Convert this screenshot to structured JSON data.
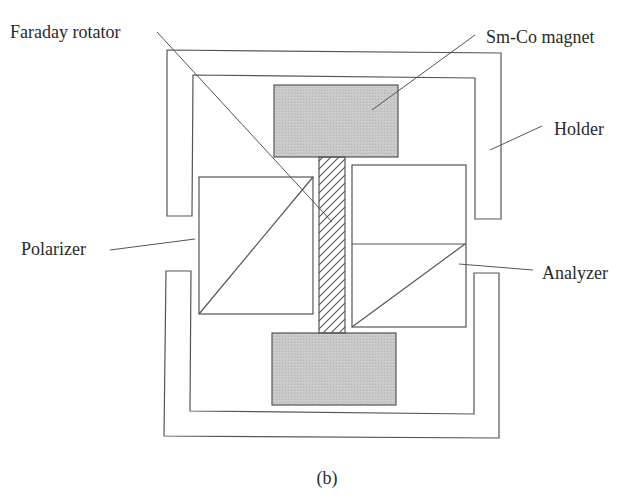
{
  "diagram": {
    "caption": "(b)",
    "colors": {
      "line": "#555555",
      "magnet_fill": "#c8c8c8",
      "text": "#2a2a2a",
      "background": "#ffffff"
    },
    "labels": {
      "faraday_rotator": "Faraday rotator",
      "sm_co_magnet": "Sm-Co magnet",
      "holder": "Holder",
      "polarizer": "Polarizer",
      "analyzer": "Analyzer"
    },
    "components": [
      {
        "id": "holder",
        "label": "Holder",
        "type": "bracket-frame"
      },
      {
        "id": "upper-magnet",
        "label": "Sm-Co magnet",
        "type": "shaded-rect"
      },
      {
        "id": "lower-magnet",
        "label": "Sm-Co magnet",
        "type": "shaded-rect"
      },
      {
        "id": "faraday-rotator",
        "label": "Faraday rotator",
        "type": "hatched-rect"
      },
      {
        "id": "polarizer",
        "label": "Polarizer",
        "type": "prism-diagonal"
      },
      {
        "id": "analyzer",
        "label": "Analyzer",
        "type": "prism-diagonal"
      }
    ]
  }
}
